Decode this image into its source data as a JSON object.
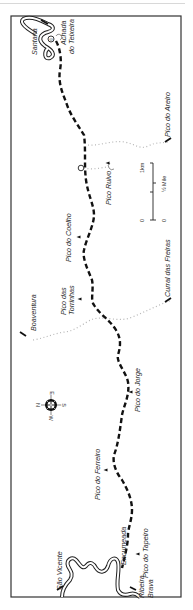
{
  "map": {
    "orientation": "rotated-90-clockwise",
    "colors": {
      "route": "#111111",
      "trail": "#b0b0b0",
      "frame": "#333333",
      "road": "#222222",
      "text": "#2a2a2a"
    },
    "places": [
      {
        "id": "santana",
        "label": "Santana"
      },
      {
        "id": "achada-teixeira-1",
        "label": "Achada"
      },
      {
        "id": "achada-teixeira-2",
        "label": "do Teixeira"
      },
      {
        "id": "pico-do-areiro",
        "label": "Pico do Areiro"
      },
      {
        "id": "pico-ruivo",
        "label": "Pico Ruivo"
      },
      {
        "id": "pico-do-coelho",
        "label": "Pico do Coelho"
      },
      {
        "id": "curral-das-freiras",
        "label": "Curral das Freiras"
      },
      {
        "id": "boaventura",
        "label": "Boaventura"
      },
      {
        "id": "pico-das-torrinhas-1",
        "label": "Pico das"
      },
      {
        "id": "pico-das-torrinhas-2",
        "label": "Torrinhas"
      },
      {
        "id": "pico-do-jorge",
        "label": "Pico do Jorge"
      },
      {
        "id": "pico-do-ferreiro",
        "label": "Pico do Ferreiro"
      },
      {
        "id": "encumeada",
        "label": "Encumeada"
      },
      {
        "id": "pico-do-tapeiro",
        "label": "Pico do Tapeiro"
      },
      {
        "id": "sao-vicente",
        "label": "São Vicente"
      },
      {
        "id": "ribeira-brava-1",
        "label": "Ribeira"
      },
      {
        "id": "ribeira-brava-2",
        "label": "Brava"
      }
    ],
    "scale": {
      "km_zero": "0",
      "km_label": "1km",
      "mile_zero": "0",
      "mile_label": "½ Mile"
    },
    "compass": {
      "n": "N",
      "s": "S",
      "e": "E",
      "w": "W"
    },
    "icons": [
      "refuge-icon",
      "peak-triangle-icon",
      "compass-rose-icon",
      "arrow-icon",
      "scale-bar-icon"
    ]
  }
}
